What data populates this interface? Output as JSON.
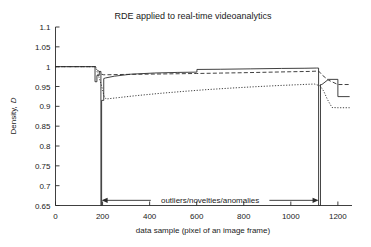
{
  "chart_data": {
    "type": "line",
    "title": "RDE applied to real-time videoanalytics",
    "xlabel": "data sample (pixel of an image frame)",
    "ylabel": "Density, D",
    "ylabel_plain": "Density,",
    "ylabel_italic": "D",
    "xlim": [
      0,
      1260
    ],
    "ylim": [
      0.65,
      1.1
    ],
    "xticks": [
      0,
      200,
      400,
      600,
      800,
      1000,
      1200
    ],
    "xticklabels": [
      "0",
      "200",
      "400",
      "600",
      "800",
      "1000",
      "1200"
    ],
    "yticks": [
      0.65,
      0.7,
      0.75,
      0.8,
      0.85,
      0.9,
      0.95,
      1,
      1.05,
      1.1
    ],
    "yticklabels": [
      "0.65",
      "0.7",
      "0.75",
      "0.8",
      "0.85",
      "0.9",
      "0.95",
      "1",
      "1.05",
      "1.1"
    ],
    "grid": false,
    "legend": "none",
    "line_color": "#2b2b2b",
    "series": [
      {
        "name": "density-solid",
        "style": "solid",
        "x": [
          0,
          168,
          168,
          176,
          176,
          186,
          186,
          193,
          193,
          196,
          196,
          205,
          205,
          212,
          250,
          320,
          420,
          520,
          600,
          601,
          601,
          700,
          830,
          960,
          1060,
          1110,
          1118,
          1118,
          1126,
          1126,
          1132,
          1160,
          1160,
          1200,
          1200,
          1250
        ],
        "y": [
          1.0,
          1.0,
          0.962,
          0.962,
          0.978,
          0.978,
          0.988,
          0.988,
          0.65,
          0.65,
          0.915,
          0.915,
          0.97,
          0.9715,
          0.976,
          0.981,
          0.984,
          0.9855,
          0.9862,
          0.9862,
          0.993,
          0.9935,
          0.9945,
          0.9955,
          0.996,
          0.9965,
          0.9965,
          0.65,
          0.65,
          0.955,
          0.955,
          0.968,
          0.968,
          0.968,
          0.9245,
          0.9245
        ]
      },
      {
        "name": "density-dashed",
        "style": "dashed",
        "x": [
          0,
          170,
          176,
          182,
          190,
          196,
          205,
          240,
          300,
          400,
          500,
          600,
          700,
          800,
          900,
          1000,
          1080,
          1118,
          1135,
          1160,
          1200,
          1250
        ],
        "y": [
          1.0,
          1.0,
          0.993,
          0.989,
          0.986,
          0.981,
          0.9795,
          0.9798,
          0.9805,
          0.9812,
          0.982,
          0.9828,
          0.9838,
          0.9848,
          0.986,
          0.9872,
          0.988,
          0.989,
          0.978,
          0.966,
          0.955,
          0.955
        ]
      },
      {
        "name": "density-dotted",
        "style": "dotted",
        "x": [
          0,
          170,
          178,
          186,
          193,
          199,
          206,
          215,
          260,
          340,
          440,
          540,
          640,
          740,
          840,
          940,
          1040,
          1100,
          1125,
          1140,
          1155,
          1175,
          1200,
          1250
        ],
        "y": [
          1.0,
          1.0,
          0.985,
          0.971,
          0.958,
          0.944,
          0.926,
          0.9185,
          0.9215,
          0.9268,
          0.9325,
          0.9375,
          0.942,
          0.9458,
          0.9492,
          0.9522,
          0.9548,
          0.9562,
          0.9515,
          0.938,
          0.918,
          0.897,
          0.8965,
          0.8965
        ]
      }
    ],
    "annotation": {
      "text": "outliers/novelties/anomalies",
      "x_start": 196,
      "x_end": 1118,
      "y": 0.663
    }
  }
}
